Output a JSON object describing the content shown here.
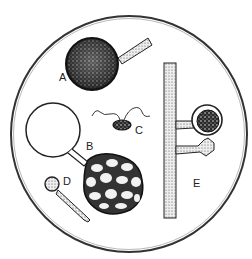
{
  "figure": {
    "labels": {
      "a": "A",
      "b": "B",
      "c": "C",
      "d": "D",
      "e": "E"
    }
  },
  "colors": {
    "ink": "#1a1a1a",
    "background": "#ffffff",
    "stipple": "#555555"
  }
}
